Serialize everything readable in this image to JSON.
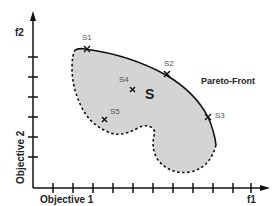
{
  "diagram": {
    "title": "",
    "axes": {
      "x": {
        "symbol": "f1",
        "label": "Objective 1",
        "tick_count": 11
      },
      "y": {
        "symbol": "f2",
        "label": "Objective 2",
        "tick_count": 6
      }
    },
    "region": {
      "label": "S",
      "fill_color": "#d4d4d4",
      "boundary": "dashed"
    },
    "pareto_front": {
      "label": "Pareto-Front",
      "style": "solid"
    },
    "points": [
      {
        "id": "S1",
        "label": "S1",
        "on_front": true
      },
      {
        "id": "S2",
        "label": "S2",
        "on_front": true
      },
      {
        "id": "S3",
        "label": "S3",
        "on_front": true
      },
      {
        "id": "S4",
        "label": "S4",
        "on_front": false
      },
      {
        "id": "S5",
        "label": "S5",
        "on_front": false
      }
    ],
    "colors": {
      "axis": "#111111",
      "region_fill": "#d4d4d4",
      "front": "#111111"
    }
  }
}
